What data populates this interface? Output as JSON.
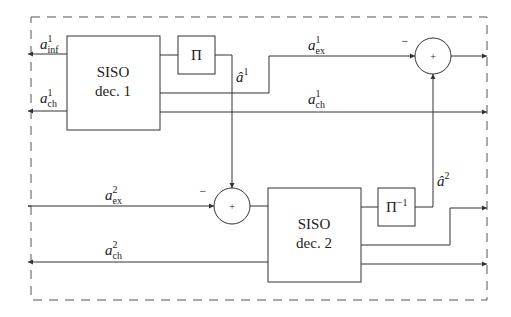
{
  "diagram": {
    "blocks": {
      "dec1": {
        "line1": "SISO",
        "line2": "dec. 1"
      },
      "dec2": {
        "line1": "SISO",
        "line2": "dec. 2"
      },
      "interleaver": {
        "label": "Π"
      },
      "deinterleaver": {
        "label": "Π",
        "exponent": "−1"
      }
    },
    "sum_nodes": {
      "top": {
        "symbol": "+",
        "sign": "−"
      },
      "bottom": {
        "symbol": "+",
        "sign": "−"
      }
    },
    "signals": {
      "a_inf_1": {
        "base": "a",
        "sup": "1",
        "sub": "inf"
      },
      "a_ch_1_in": {
        "base": "a",
        "sup": "1",
        "sub": "ch"
      },
      "a_hat_1": {
        "base": "â",
        "sup": "1"
      },
      "a_ex_1": {
        "base": "a",
        "sup": "1",
        "sub": "ex"
      },
      "a_ch_1_out": {
        "base": "a",
        "sup": "1",
        "sub": "ch"
      },
      "a_ex_2": {
        "base": "a",
        "sup": "2",
        "sub": "ex"
      },
      "a_ch_2": {
        "base": "a",
        "sup": "2",
        "sub": "ch"
      },
      "a_hat_2": {
        "base": "â",
        "sup": "2"
      }
    }
  }
}
